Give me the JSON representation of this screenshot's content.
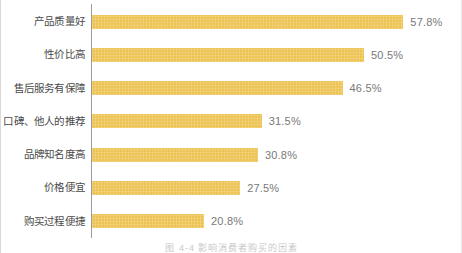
{
  "chart_data": {
    "type": "bar",
    "orientation": "horizontal",
    "title": "",
    "xlabel": "",
    "ylabel": "",
    "xlim": [
      0,
      62
    ],
    "grid": false,
    "legend": null,
    "bar_color": "#edc354",
    "label_color": "#787878",
    "category_color": "#4a4a4a",
    "axis_color": "#9a9a9a",
    "categories": [
      "产品质量好",
      "性价比高",
      "售后服务有保障",
      "口碑、他人的推荐",
      "品牌知名度高",
      "价格便宜",
      "购买过程便捷"
    ],
    "values": [
      57.8,
      50.5,
      46.5,
      31.5,
      30.8,
      27.5,
      20.8
    ],
    "value_labels": [
      "57.8%",
      "50.5%",
      "46.5%",
      "31.5%",
      "30.8%",
      "27.5%",
      "20.8%"
    ]
  },
  "caption": "图 4-4  影响消费者购买的因素"
}
